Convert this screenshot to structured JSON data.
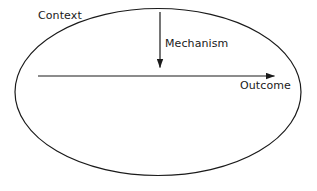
{
  "diagram": {
    "type": "context-mechanism-outcome",
    "background_color": "#ffffff",
    "stroke_color": "#1a1a1a",
    "text_color": "#1a1a1a",
    "shapes": {
      "boundary": {
        "kind": "ellipse",
        "cx": 158,
        "cy": 92,
        "rx": 143,
        "ry": 83.5,
        "stroke_width": 1.2,
        "fill": "none"
      },
      "outcome_arrow": {
        "kind": "arrow",
        "x1": 38,
        "y1": 76,
        "x2": 283,
        "y2": 76,
        "stroke_width": 1.2,
        "arrowhead": "solid-triangle"
      },
      "mechanism_arrow": {
        "kind": "arrow",
        "x1": 160,
        "y1": 12,
        "x2": 160,
        "y2": 76,
        "stroke_width": 1.2,
        "arrowhead": "solid-triangle"
      }
    },
    "labels": {
      "context": "Context",
      "mechanism": "Mechanism",
      "outcome": "Outcome"
    }
  }
}
